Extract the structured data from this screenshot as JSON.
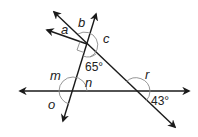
{
  "diagram": {
    "labels": {
      "a": "a",
      "b": "b",
      "c": "c",
      "m": "m",
      "n": "n",
      "o": "o",
      "r": "r"
    },
    "given_angles": {
      "upper_intersection": "65°",
      "lower_right_intersection": "43°"
    },
    "markers": [
      "right-angle-marker"
    ],
    "colors": {
      "line": "#1a1a1a",
      "arc": "#8a8a8a",
      "text": "#222222"
    }
  }
}
